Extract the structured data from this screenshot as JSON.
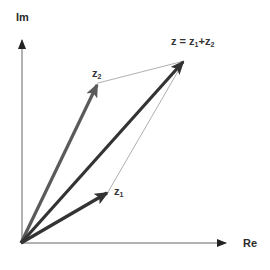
{
  "diagram": {
    "axes": {
      "x_label": "Re",
      "y_label": "Im"
    },
    "vectors": [
      {
        "name": "z1",
        "base": "z",
        "sub": "1",
        "color": "#333333"
      },
      {
        "name": "z2",
        "base": "z",
        "sub": "2",
        "color": "#555555"
      },
      {
        "name": "z",
        "color": "#333333"
      }
    ],
    "sum_label": {
      "lhs": "z = z",
      "sub1": "1",
      "plus": "+z",
      "sub2": "2"
    },
    "colors": {
      "axis": "#555555",
      "vector_dark": "#333333",
      "vector_mid": "#595959",
      "guide": "#9a9a9a"
    }
  }
}
